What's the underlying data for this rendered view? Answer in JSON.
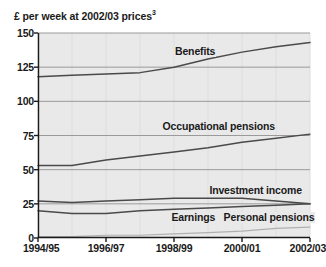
{
  "figure": {
    "axis_caption": "£ per week at 2002/03 prices",
    "axis_caption_superscript": "3"
  },
  "axes": {
    "y_ticks": [
      "0",
      "25",
      "50",
      "75",
      "100",
      "125",
      "150"
    ],
    "x_ticks": [
      "1994/95",
      "1996/97",
      "1998/99",
      "2000/01",
      "2002/03"
    ]
  },
  "series_labels": {
    "benefits": "Benefits",
    "occupational_pensions": "Occupational pensions",
    "investment_income": "Investment income",
    "earnings": "Earnings",
    "personal_pensions": "Personal pensions"
  },
  "colors": {
    "plot_background": "#e9e9e9",
    "gridline": "#9a9a9a",
    "axis": "#1a1a1a",
    "line_dark": "#4a4a4a",
    "line_light": "#b0b0b0"
  },
  "chart_data": {
    "type": "line",
    "title": "",
    "subtitle": "",
    "xlabel": "",
    "ylabel": "£ per week at 2002/03 prices",
    "ylim": [
      0,
      150
    ],
    "ytick_values": [
      0,
      25,
      50,
      75,
      100,
      125,
      150
    ],
    "grid": true,
    "legend_position": "inline-annotations",
    "x": [
      "1994/95",
      "1995/96",
      "1996/97",
      "1997/98",
      "1998/99",
      "1999/00",
      "2000/01",
      "2001/02",
      "2002/03"
    ],
    "xtick_labels": [
      "1994/95",
      "1996/97",
      "1998/99",
      "2000/01",
      "2002/03"
    ],
    "series": [
      {
        "name": "Benefits",
        "values": [
          118,
          119,
          120,
          121,
          125,
          131,
          136,
          140,
          143
        ]
      },
      {
        "name": "Occupational pensions",
        "values": [
          53,
          53,
          57,
          60,
          63,
          66,
          70,
          73,
          76
        ]
      },
      {
        "name": "Investment income",
        "values": [
          27,
          26,
          27,
          28,
          29,
          29,
          29,
          27,
          25
        ]
      },
      {
        "name": "Earnings",
        "values": [
          20,
          18,
          18,
          20,
          21,
          22,
          23,
          24,
          25
        ]
      },
      {
        "name": "Personal pensions",
        "values": [
          1,
          1,
          2,
          2,
          3,
          4,
          5,
          7,
          8
        ]
      }
    ]
  }
}
